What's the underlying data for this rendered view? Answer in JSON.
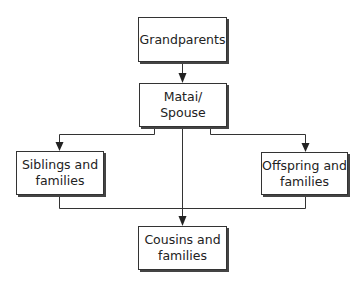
{
  "diagram": {
    "type": "flowchart",
    "nodes": [
      {
        "id": "grandparents",
        "lines": [
          "Grandparents"
        ]
      },
      {
        "id": "matai",
        "lines": [
          "Matai/",
          "Spouse"
        ]
      },
      {
        "id": "siblings",
        "lines": [
          "Siblings and",
          "families"
        ]
      },
      {
        "id": "offspring",
        "lines": [
          "Offspring and",
          "families"
        ]
      },
      {
        "id": "cousins",
        "lines": [
          "Cousins and",
          "families"
        ]
      }
    ],
    "edges": [
      {
        "from": "grandparents",
        "to": "matai"
      },
      {
        "from": "matai",
        "to": "siblings"
      },
      {
        "from": "matai",
        "to": "offspring"
      },
      {
        "from": "matai",
        "to": "cousins"
      },
      {
        "from": "siblings",
        "to": "cousins"
      },
      {
        "from": "offspring",
        "to": "cousins"
      }
    ],
    "colors": {
      "line": "#333333",
      "box_border": "#333333",
      "shadow": "#444444",
      "text": "#222222"
    }
  }
}
